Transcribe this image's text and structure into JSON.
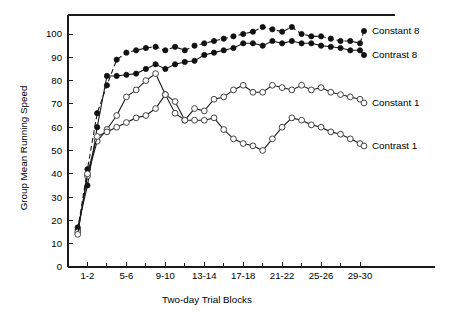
{
  "chart_data": {
    "type": "line",
    "title": "",
    "xlabel": "Two-day Trial Blocks",
    "ylabel": "Group Mean Running Speed",
    "xlim": [
      0,
      30
    ],
    "ylim": [
      0,
      105
    ],
    "ytick_values": [
      0,
      10,
      20,
      30,
      40,
      50,
      60,
      70,
      80,
      90,
      100
    ],
    "ytick_labels": [
      "0",
      "10",
      "20",
      "30",
      "40",
      "50",
      "60",
      "70",
      "80",
      "90",
      "100"
    ],
    "xtick_values": [
      2,
      6,
      10,
      14,
      18,
      22,
      26,
      30
    ],
    "xtick_labels": [
      "1-2",
      "5-6",
      "9-10",
      "13-14",
      "17-18",
      "21-22",
      "25-26",
      "29-30"
    ],
    "xminor_values": [
      4,
      8,
      12,
      16,
      20,
      24,
      28
    ],
    "grid": false,
    "legend_position": "right-inline",
    "x": [
      1,
      2,
      3,
      4,
      5,
      6,
      7,
      8,
      9,
      10,
      11,
      12,
      13,
      14,
      15,
      16,
      17,
      18,
      19,
      20,
      21,
      22,
      23,
      24,
      25,
      26,
      27,
      28,
      29,
      30
    ],
    "series": [
      {
        "name": "Constant 8",
        "marker": "filled-circle",
        "linestyle": "dashed",
        "color": "#111111",
        "values": [
          16,
          42,
          66,
          78,
          89,
          92,
          93,
          94,
          94.5,
          93,
          94.5,
          93,
          95,
          96,
          97,
          98,
          99,
          100,
          101,
          103,
          102,
          101,
          103,
          100,
          99,
          99,
          98,
          97,
          97,
          96
        ]
      },
      {
        "name": "Contrast 8",
        "marker": "filled-circle",
        "linestyle": "solid",
        "color": "#111111",
        "values": [
          17,
          35,
          60,
          82,
          82,
          82.5,
          83,
          85,
          87,
          85,
          87,
          88,
          88.5,
          91,
          92,
          93,
          94,
          96,
          96,
          95,
          97,
          96,
          97,
          96,
          96,
          95,
          94.5,
          94,
          93,
          93
        ]
      },
      {
        "name": "Constant 1",
        "marker": "open-circle",
        "linestyle": "solid",
        "color": "#444444",
        "values": [
          15,
          39,
          54,
          59,
          65,
          73,
          76,
          80,
          83,
          74,
          71,
          63,
          68,
          67,
          72,
          73,
          76,
          78,
          75,
          75,
          78,
          77,
          76,
          78,
          76,
          77,
          75,
          74,
          73,
          72
        ]
      },
      {
        "name": "Contrast 1",
        "marker": "open-circle",
        "linestyle": "solid",
        "color": "#444444",
        "values": [
          14,
          40,
          56,
          58,
          60,
          62,
          64,
          65,
          68,
          74,
          66,
          63,
          63,
          63,
          64,
          59,
          55,
          53,
          52,
          50,
          55,
          60,
          64,
          63,
          61,
          60,
          58,
          57,
          55,
          53
        ]
      }
    ],
    "legend_labels": [
      "Constant 8",
      "Contrast 8",
      "Constant 1",
      "Contrast 1"
    ]
  }
}
